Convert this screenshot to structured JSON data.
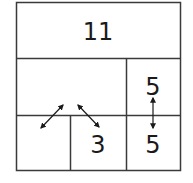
{
  "puzzle": {
    "colors": {
      "line": "#3a3a3a",
      "text": "#1a1a1a",
      "background": "#ffffff"
    },
    "cells": [
      {
        "id": "top",
        "value": "11"
      },
      {
        "id": "middle-left",
        "value": ""
      },
      {
        "id": "right-top",
        "value": "5"
      },
      {
        "id": "bottom-left",
        "value": ""
      },
      {
        "id": "bottom-middle",
        "value": "3"
      },
      {
        "id": "bottom-right",
        "value": "5"
      }
    ],
    "arrows": [
      {
        "id": "arrow-diag-left",
        "type": "double-headed"
      },
      {
        "id": "arrow-diag-right",
        "type": "double-headed"
      },
      {
        "id": "arrow-vertical",
        "type": "double-headed"
      }
    ]
  }
}
